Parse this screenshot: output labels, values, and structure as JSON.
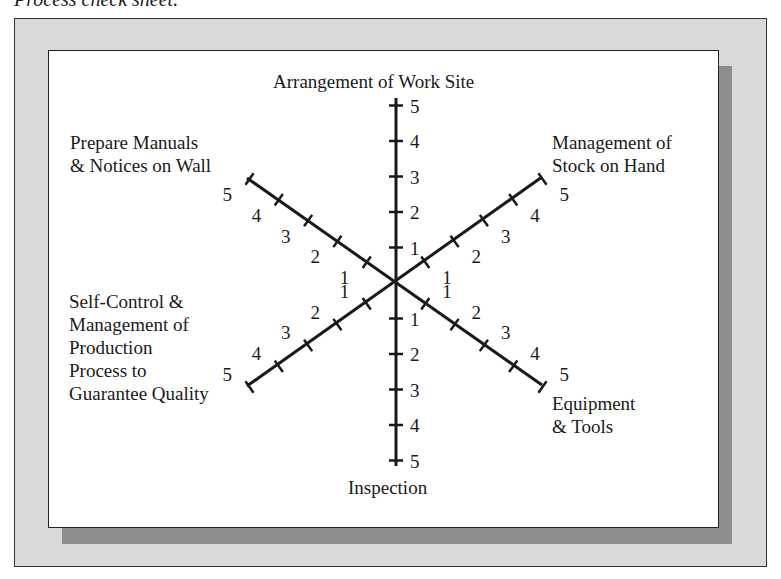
{
  "caption": "Process check sheet.",
  "diagram": {
    "type": "radar-axes",
    "axes": [
      {
        "id": "top",
        "label_lines": [
          "Arrangement of Work Site"
        ]
      },
      {
        "id": "upper-right",
        "label_lines": [
          "Management of",
          "Stock on Hand"
        ]
      },
      {
        "id": "lower-right",
        "label_lines": [
          "Equipment",
          "& Tools"
        ]
      },
      {
        "id": "bottom",
        "label_lines": [
          "Inspection"
        ]
      },
      {
        "id": "lower-left",
        "label_lines": [
          "Self-Control &",
          "Management of",
          "Production",
          "Process to",
          "Guarantee Quality"
        ]
      },
      {
        "id": "upper-left",
        "label_lines": [
          "Prepare Manuals",
          "& Notices on Wall"
        ]
      }
    ],
    "scale": [
      "1",
      "2",
      "3",
      "4",
      "5"
    ]
  }
}
